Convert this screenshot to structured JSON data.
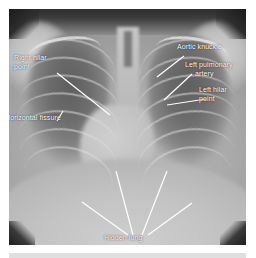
{
  "figure": {
    "modality": "chest-x-ray",
    "view": "posteroanterior",
    "annotation_color": "#ffffff",
    "film_tone": "#a9a9a9"
  },
  "annotations": [
    {
      "id": "right-hilar-point",
      "label": "Right hilar point",
      "label_lines": [
        "Right hilar",
        "point"
      ],
      "text_x": 14,
      "text_y": 53,
      "leader": {
        "x1": 48,
        "y1": 64,
        "x2": 101,
        "y2": 106
      }
    },
    {
      "id": "horizontal-fissure",
      "label": "Horizontal fissure",
      "label_lines": [
        "Horizontal fissure"
      ],
      "text_x": 5,
      "text_y": 113,
      "leader": {
        "x1": 48,
        "y1": 112,
        "x2": 54,
        "y2": 102
      }
    },
    {
      "id": "aortic-knuckle",
      "label": "Aortic knuckle",
      "label_lines": [
        "Aortic knuckle"
      ],
      "text_x": 177,
      "text_y": 42,
      "leader": {
        "x1": 175,
        "y1": 47,
        "x2": 148,
        "y2": 68
      }
    },
    {
      "id": "left-pulmonary-artery",
      "label": "Left pulmonary artery",
      "label_lines": [
        "Left pulmonary",
        "artery"
      ],
      "text_x": 185,
      "text_y": 60,
      "leader": {
        "x1": 183,
        "y1": 65,
        "x2": 155,
        "y2": 91
      }
    },
    {
      "id": "left-hilar-point",
      "label": "Left hilar point",
      "label_lines": [
        "Left hilar",
        "point"
      ],
      "text_x": 199,
      "text_y": 85,
      "leader": {
        "x1": 197,
        "y1": 90,
        "x2": 158,
        "y2": 96
      }
    },
    {
      "id": "hidden-lung",
      "label": "Hidden lung",
      "label_lines": [
        "Hidden lung"
      ],
      "text_x": 104,
      "text_y": 229,
      "leaders": [
        {
          "x1": 119,
          "y1": 226,
          "x2": 73,
          "y2": 193
        },
        {
          "x1": 124,
          "y1": 226,
          "x2": 107,
          "y2": 162
        },
        {
          "x1": 133,
          "y1": 226,
          "x2": 158,
          "y2": 162
        },
        {
          "x1": 139,
          "y1": 226,
          "x2": 183,
          "y2": 194
        }
      ]
    }
  ],
  "anatomy": {
    "structures": [
      "right lung field",
      "left lung field",
      "trachea",
      "thoracic spine",
      "cardiac silhouette",
      "right hemidiaphragm",
      "left hemidiaphragm",
      "clavicles",
      "ribs"
    ]
  }
}
